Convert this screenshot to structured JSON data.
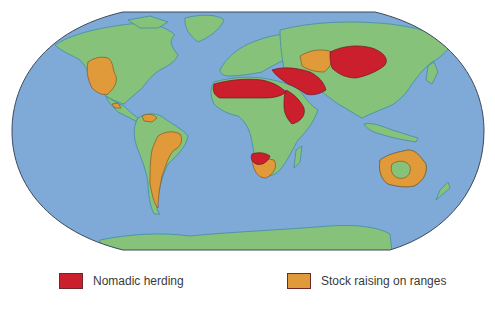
{
  "map": {
    "projection": "Robinson-style world map",
    "colors": {
      "ocean": "#7fa9d6",
      "land": "#86c27a",
      "coast": "#3f8fa8",
      "border": "#3d4a5c",
      "nomadic_herding": "#cc1f2e",
      "stock_raising": "#e09a3a"
    },
    "regions": {
      "nomadic_herding": [
        "North Africa / Sahara",
        "Arabian Peninsula & Middle East",
        "Horn of Africa",
        "Central Asia / Mongolia",
        "Southwest Africa (Namibia/Kalahari)"
      ],
      "stock_raising": [
        "Western United States",
        "Central America",
        "Northern South America (Venezuela)",
        "Eastern Brazil & Argentina/Patagonia",
        "Kazakhstan steppe",
        "South Africa",
        "Australia (interior ring)"
      ]
    }
  },
  "legend": {
    "items": [
      {
        "label": "Nomadic herding",
        "color": "#cc1f2e"
      },
      {
        "label": "Stock raising on ranges",
        "color": "#e09a3a"
      }
    ]
  }
}
